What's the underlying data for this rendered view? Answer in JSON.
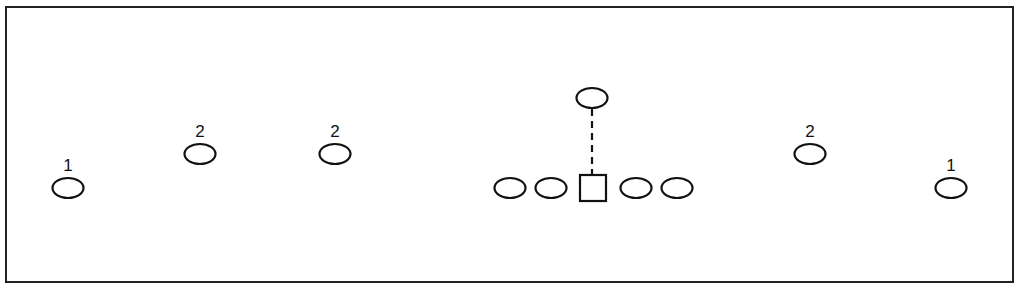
{
  "diagram": {
    "title": "",
    "frame": {
      "x": 6,
      "y": 7,
      "width": 1007,
      "height": 275,
      "stroke": "#222222"
    },
    "stroke_color": "#111111",
    "players": [
      {
        "id": "wide-left",
        "shape": "ellipse",
        "cx": 68,
        "cy": 188,
        "label": "1"
      },
      {
        "id": "slot-left-outer",
        "shape": "ellipse",
        "cx": 200,
        "cy": 154,
        "label": "2"
      },
      {
        "id": "slot-left-inner",
        "shape": "ellipse",
        "cx": 335,
        "cy": 154,
        "label": "2"
      },
      {
        "id": "line-left-tackle",
        "shape": "ellipse",
        "cx": 510,
        "cy": 188,
        "label": ""
      },
      {
        "id": "line-left-guard",
        "shape": "ellipse",
        "cx": 551,
        "cy": 188,
        "label": ""
      },
      {
        "id": "center",
        "shape": "square",
        "cx": 593,
        "cy": 188,
        "label": ""
      },
      {
        "id": "line-right-guard",
        "shape": "ellipse",
        "cx": 636,
        "cy": 188,
        "label": ""
      },
      {
        "id": "line-right-tackle",
        "shape": "ellipse",
        "cx": 677,
        "cy": 188,
        "label": ""
      },
      {
        "id": "quarterback",
        "shape": "ellipse",
        "cx": 592,
        "cy": 98,
        "label": ""
      },
      {
        "id": "slot-right",
        "shape": "ellipse",
        "cx": 810,
        "cy": 154,
        "label": "2"
      },
      {
        "id": "wide-right",
        "shape": "ellipse",
        "cx": 951,
        "cy": 188,
        "label": "1"
      }
    ],
    "connectors": [
      {
        "id": "qb-to-center",
        "style": "dashed",
        "x1": 592,
        "y1": 109,
        "x2": 592,
        "y2": 174
      }
    ]
  }
}
